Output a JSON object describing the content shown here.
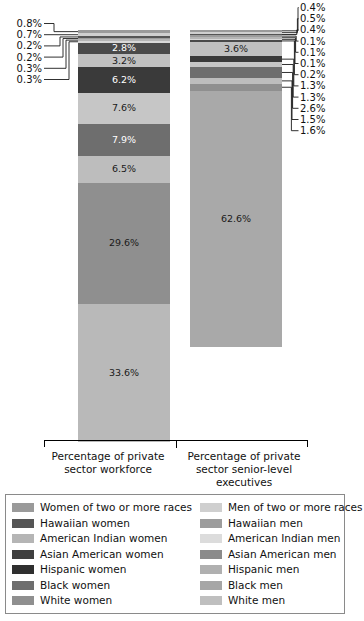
{
  "chart_data": {
    "type": "bar",
    "subtype": "stacked-bar-100",
    "title": "",
    "xlabel": "",
    "ylabel": "",
    "ylim": [
      0,
      100
    ],
    "grid": false,
    "legend_position": "bottom",
    "categories": [
      "Percentage of private sector workforce",
      "Percentage of private sector senior-level executives"
    ],
    "series": [
      {
        "name": "White men",
        "color": "#a9a9a9",
        "values": [
          33.6,
          62.6
        ]
      },
      {
        "name": "White women",
        "color": "#8f8f8f",
        "values": [
          29.6,
          1.6
        ]
      },
      {
        "name": "Black men",
        "color": "#bdbdbd",
        "values": [
          6.5,
          1.5
        ]
      },
      {
        "name": "Black women",
        "color": "#6e6e6e",
        "values": [
          7.9,
          2.6
        ]
      },
      {
        "name": "Hispanic men",
        "color": "#c6c6c6",
        "values": [
          7.6,
          1.3
        ]
      },
      {
        "name": "Hispanic women",
        "color": "#3a3a3a",
        "values": [
          6.2,
          1.3
        ]
      },
      {
        "name": "Asian American men",
        "color": "#c0c0c0",
        "values": [
          3.2,
          3.6
        ]
      },
      {
        "name": "Asian American women",
        "color": "#4a4a4a",
        "values": [
          2.8,
          0.2
        ]
      },
      {
        "name": "American Indian men",
        "color": "#d8d8d8",
        "values": [
          0.3,
          0.1
        ]
      },
      {
        "name": "American Indian women",
        "color": "#b5b5b5",
        "values": [
          0.3,
          0.1
        ]
      },
      {
        "name": "Hawaiian men",
        "color": "#9c9c9c",
        "values": [
          0.2,
          0.1
        ]
      },
      {
        "name": "Hawaiian women",
        "color": "#555555",
        "values": [
          0.2,
          0.4
        ]
      },
      {
        "name": "Men of two or more races",
        "color": "#cfcfcf",
        "values": [
          0.7,
          0.5
        ]
      },
      {
        "name": "Women of two or more races",
        "color": "#9a9a9a",
        "values": [
          0.8,
          0.4
        ]
      }
    ]
  },
  "bars": {
    "left": {
      "name": "Percentage of private sector workforce",
      "segments": [
        {
          "label": "0.8%",
          "value": 0.8,
          "color": "#9a9a9a",
          "series": "Women of two or more races",
          "inside": false,
          "side": "left"
        },
        {
          "label": "0.7%",
          "value": 0.7,
          "color": "#cfcfcf",
          "series": "Men of two or more races",
          "inside": false,
          "side": "left"
        },
        {
          "label": "0.2%",
          "value": 0.2,
          "color": "#555555",
          "series": "Hawaiian women",
          "inside": false,
          "side": "left"
        },
        {
          "label": "0.2%",
          "value": 0.2,
          "color": "#9c9c9c",
          "series": "Hawaiian men",
          "inside": false,
          "side": "left"
        },
        {
          "label": "0.3%",
          "value": 0.3,
          "color": "#b5b5b5",
          "series": "American Indian women",
          "inside": false,
          "side": "left"
        },
        {
          "label": "0.3%",
          "value": 0.3,
          "color": "#d8d8d8",
          "series": "American Indian men",
          "inside": false,
          "side": "left"
        },
        {
          "label": "2.8%",
          "value": 2.8,
          "color": "#4a4a4a",
          "series": "Asian American women",
          "inside": true,
          "ink": "light"
        },
        {
          "label": "3.2%",
          "value": 3.2,
          "color": "#c0c0c0",
          "series": "Asian American men",
          "inside": true,
          "ink": "dark"
        },
        {
          "label": "6.2%",
          "value": 6.2,
          "color": "#3a3a3a",
          "series": "Hispanic women",
          "inside": true,
          "ink": "light"
        },
        {
          "label": "7.6%",
          "value": 7.6,
          "color": "#c6c6c6",
          "series": "Hispanic men",
          "inside": true,
          "ink": "dark"
        },
        {
          "label": "7.9%",
          "value": 7.9,
          "color": "#6e6e6e",
          "series": "Black women",
          "inside": true,
          "ink": "light"
        },
        {
          "label": "6.5%",
          "value": 6.5,
          "color": "#bdbdbd",
          "series": "Black men",
          "inside": true,
          "ink": "dark"
        },
        {
          "label": "29.6%",
          "value": 29.6,
          "color": "#8f8f8f",
          "series": "White women",
          "inside": true,
          "ink": "dark"
        },
        {
          "label": "33.6%",
          "value": 33.6,
          "color": "#b9b9b9",
          "series": "White men",
          "inside": true,
          "ink": "dark"
        }
      ]
    },
    "right": {
      "name": "Percentage of private sector senior-level executives",
      "segments": [
        {
          "label": "0.4%",
          "value": 0.4,
          "color": "#9a9a9a",
          "series": "Women of two or more races",
          "inside": false,
          "side": "right"
        },
        {
          "label": "0.5%",
          "value": 0.5,
          "color": "#cfcfcf",
          "series": "Men of two or more races",
          "inside": false,
          "side": "right"
        },
        {
          "label": "0.4%",
          "value": 0.4,
          "color": "#555555",
          "series": "Hawaiian women",
          "inside": false,
          "side": "right"
        },
        {
          "label": "0.1%",
          "value": 0.1,
          "color": "#9c9c9c",
          "series": "Hawaiian men",
          "inside": false,
          "side": "right"
        },
        {
          "label": "0.1%",
          "value": 0.1,
          "color": "#b5b5b5",
          "series": "American Indian women",
          "inside": false,
          "side": "right"
        },
        {
          "label": "0.1%",
          "value": 0.1,
          "color": "#d8d8d8",
          "series": "American Indian men",
          "inside": false,
          "side": "right"
        },
        {
          "label": "0.2%",
          "value": 0.2,
          "color": "#4a4a4a",
          "series": "Asian American women",
          "inside": false,
          "side": "right"
        },
        {
          "label": "3.6%",
          "value": 3.6,
          "color": "#c0c0c0",
          "series": "Asian American men",
          "inside": true,
          "ink": "dark"
        },
        {
          "label": "1.3%",
          "value": 1.3,
          "color": "#3a3a3a",
          "series": "Hispanic women",
          "inside": false,
          "side": "right"
        },
        {
          "label": "1.3%",
          "value": 1.3,
          "color": "#c6c6c6",
          "series": "Hispanic men",
          "inside": false,
          "side": "right"
        },
        {
          "label": "2.6%",
          "value": 2.6,
          "color": "#6e6e6e",
          "series": "Black women",
          "inside": false,
          "side": "right"
        },
        {
          "label": "1.5%",
          "value": 1.5,
          "color": "#bdbdbd",
          "series": "Black men",
          "inside": false,
          "side": "right"
        },
        {
          "label": "1.6%",
          "value": 1.6,
          "color": "#8f8f8f",
          "series": "White women",
          "inside": false,
          "side": "right"
        },
        {
          "label": "62.6%",
          "value": 62.6,
          "color": "#a9a9a9",
          "series": "White men",
          "inside": true,
          "ink": "dark"
        }
      ]
    }
  },
  "axis": {
    "categories": [
      {
        "line1": "Percentage of private",
        "line2": "sector workforce",
        "line3": ""
      },
      {
        "line1": "Percentage of private",
        "line2": "sector senior-level",
        "line3": "executives"
      }
    ]
  },
  "legend": {
    "left_column": [
      {
        "label": "Women of two or more races",
        "color": "#9a9a9a"
      },
      {
        "label": "Hawaiian women",
        "color": "#555555"
      },
      {
        "label": "American Indian women",
        "color": "#b5b5b5"
      },
      {
        "label": "Asian American women",
        "color": "#3f3f3f"
      },
      {
        "label": "Hispanic women",
        "color": "#2f2f2f"
      },
      {
        "label": "Black women",
        "color": "#6e6e6e"
      },
      {
        "label": "White women",
        "color": "#8f8f8f"
      }
    ],
    "right_column": [
      {
        "label": "Men of two or more races",
        "color": "#cfcfcf"
      },
      {
        "label": "Hawaiian men",
        "color": "#9c9c9c"
      },
      {
        "label": "American Indian men",
        "color": "#dcdcdc"
      },
      {
        "label": "Asian American men",
        "color": "#8b8b8b"
      },
      {
        "label": "Hispanic men",
        "color": "#b0b0b0"
      },
      {
        "label": "Black men",
        "color": "#a6a6a6"
      },
      {
        "label": "White men",
        "color": "#bfbfbf"
      }
    ]
  }
}
